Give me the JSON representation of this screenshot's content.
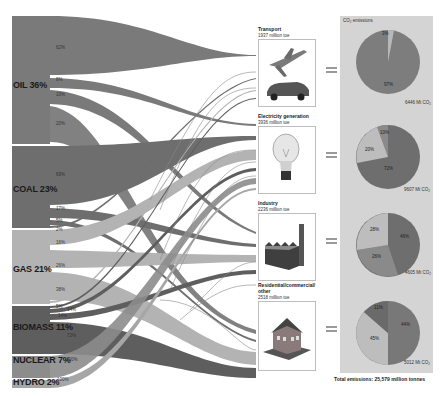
{
  "sources": [
    {
      "name": "OIL",
      "share": "36%",
      "label": "OIL 36%",
      "color": "#7a7a7a",
      "flows": [
        "62%",
        "8%",
        "10%",
        "20%"
      ]
    },
    {
      "name": "COAL",
      "share": "23%",
      "label": "COAL 23%",
      "color": "#6e6e6e",
      "flows": [
        "69%",
        "17%",
        "5%",
        "2%"
      ]
    },
    {
      "name": "GAS",
      "share": "21%",
      "label": "GAS 21%",
      "color": "#b3b3b3",
      "flows": [
        "16%",
        "26%",
        "38%",
        "5%"
      ]
    },
    {
      "name": "BIOMASS",
      "share": "11%",
      "label": "BIOMASS 11%",
      "color": "#5e5e5e",
      "flows": [
        "1%",
        "14%",
        "14%",
        "72%"
      ]
    },
    {
      "name": "NUCLEAR",
      "share": "7%",
      "label": "NUCLEAR 7%",
      "color": "#8c8c8c",
      "flows": [
        "100%"
      ]
    },
    {
      "name": "HYDRO",
      "share": "2%",
      "label": "HYDRO 2%",
      "color": "#a6a6a6",
      "flows": [
        "100%"
      ]
    }
  ],
  "sectors": [
    {
      "name": "Transport",
      "value": "1937 million toe",
      "icon": "airplane-car-icon",
      "emissions": "6446 Mt CO₂",
      "pie": [
        {
          "label": "97%",
          "value": 97,
          "color": "#7d7d7d"
        },
        {
          "label": "3%",
          "value": 3,
          "color": "#b8b8b8"
        }
      ]
    },
    {
      "name": "Electricity generation",
      "value": "3936 million toe",
      "icon": "lightbulb-icon",
      "emissions": "9607 Mt CO₂",
      "pie": [
        {
          "label": "72%",
          "value": 72,
          "color": "#6e6e6e"
        },
        {
          "label": "10%",
          "value": 10,
          "color": "#8a8a8a"
        },
        {
          "label": "20%",
          "value": 18,
          "color": "#bdbdbd"
        }
      ]
    },
    {
      "name": "Industry",
      "value": "2236 million toe",
      "icon": "factory-icon",
      "emissions": "4605 Mt CO₂",
      "pie": [
        {
          "label": "46%",
          "value": 46,
          "color": "#6e6e6e"
        },
        {
          "label": "26%",
          "value": 26,
          "color": "#8a8a8a"
        },
        {
          "label": "28%",
          "value": 28,
          "color": "#bdbdbd"
        }
      ]
    },
    {
      "name": "Residential/commercial/ other",
      "value": "2518 million toe",
      "icon": "house-icon",
      "emissions": "5012 Mt CO₂",
      "pie": [
        {
          "label": "44%",
          "value": 44,
          "color": "#787878"
        },
        {
          "label": "45%",
          "value": 45,
          "color": "#bdbdbd"
        },
        {
          "label": "11%",
          "value": 11,
          "color": "#6a6a6a"
        }
      ]
    }
  ],
  "emissions_panel": {
    "title": "CO₂ emissions",
    "total": "Total emissions: 25,579 million tonnes"
  }
}
